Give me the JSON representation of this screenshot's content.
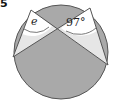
{
  "question_number": "5",
  "diagram": {
    "type": "circle-theorem",
    "labels": {
      "angle_unknown": "e",
      "angle_known": "97°"
    },
    "colors": {
      "shaded": "#a9a9a9",
      "light": "#e6e6e6",
      "white": "#ffffff",
      "stroke": "#555555"
    }
  }
}
